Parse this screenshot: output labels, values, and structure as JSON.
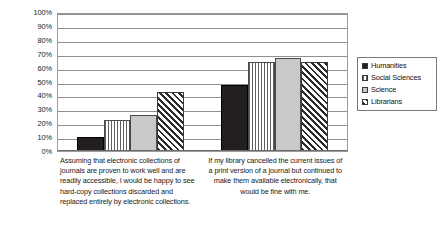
{
  "chart_data": {
    "type": "bar",
    "title": "",
    "xlabel": "",
    "ylabel": "",
    "ylim": [
      0,
      100
    ],
    "grid": true,
    "legend_position": "right",
    "y_ticks": [
      "100%",
      "90%",
      "80%",
      "70%",
      "60%",
      "50%",
      "40%",
      "30%",
      "20%",
      "10%",
      "0%"
    ],
    "categories": [
      "Assuming that electronic collections of journals are proven to work well and are readily accessible, I would be happy to see hard-copy collections discarded and replaced entirely by electronic collections.",
      "If my library cancelled the current issues of a print version of a journal but continued to make them available electronically, that would be fine with me."
    ],
    "series": [
      {
        "name": "Humanities",
        "values": [
          10,
          48
        ],
        "pattern": "solid-black",
        "color": "#231f20"
      },
      {
        "name": "Social Sciences",
        "values": [
          23,
          65
        ],
        "pattern": "vertical-stripes",
        "color": "#5f5f5f"
      },
      {
        "name": "Science",
        "values": [
          26,
          68
        ],
        "pattern": "solid-light-gray",
        "color": "#c9c9c9"
      },
      {
        "name": "Librarians",
        "values": [
          43,
          65
        ],
        "pattern": "diagonal-hatch",
        "color": "#2b2b2b"
      }
    ]
  }
}
